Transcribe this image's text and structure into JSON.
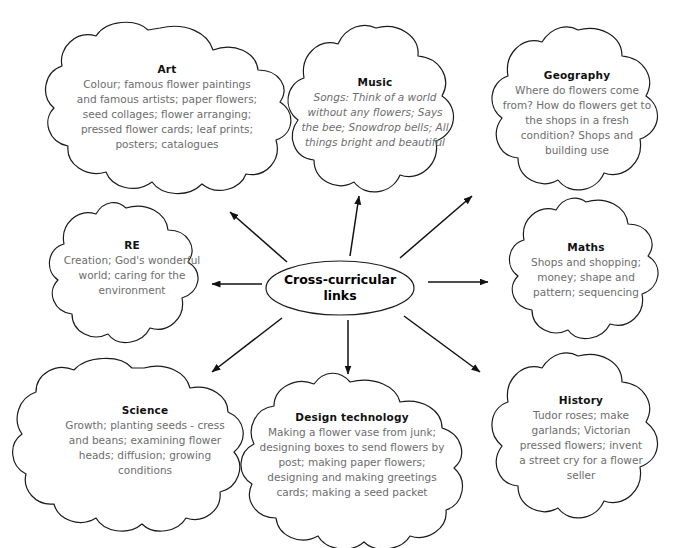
{
  "diagram": {
    "type": "mind-map",
    "title": "Cross-curricular links",
    "center": {
      "label": "Cross-curricular links",
      "shape": "ellipse"
    },
    "background_color": "#ffffff",
    "outline_color": "#1a1a1a",
    "body_text_color": "#6d6d6d",
    "arrow_count": 8,
    "nodes": [
      {
        "id": "art",
        "title": "Art",
        "body": "Colour; famous flower paintings and famous artists; paper flowers; seed collages; flower arranging; pressed flower cards; leaf prints; posters; catalogues",
        "position": "top-left",
        "shape": "cloud"
      },
      {
        "id": "music",
        "title": "Music",
        "body": "Songs: Think of a world without any flowers; Says the bee; Snowdrop bells; All things bright and beautiful",
        "position": "top-center",
        "shape": "flower",
        "italic": true
      },
      {
        "id": "geography",
        "title": "Geography",
        "body": "Where do flowers come from? How do flowers get to the shops in a fresh condition? Shops and building use",
        "position": "top-right",
        "shape": "flower"
      },
      {
        "id": "re",
        "title": "RE",
        "body": "Creation; God's wonderful world; caring for the environment",
        "position": "middle-left",
        "shape": "flower"
      },
      {
        "id": "maths",
        "title": "Maths",
        "body": "Shops and shopping; money; shape and pattern; sequencing",
        "position": "middle-right",
        "shape": "flower"
      },
      {
        "id": "science",
        "title": "Science",
        "body": "Growth; planting seeds - cress and beans; examining flower heads; diffusion; growing conditions",
        "position": "bottom-left",
        "shape": "cloud"
      },
      {
        "id": "design-technology",
        "title": "Design technology",
        "body": "Making a flower vase from junk; designing boxes to send flowers by post; making paper flowers; designing and making greetings cards; making a seed packet",
        "position": "bottom-center",
        "shape": "cloud"
      },
      {
        "id": "history",
        "title": "History",
        "body": "Tudor roses; make garlands; Victorian pressed flowers; invent a street cry for a flower seller",
        "position": "bottom-right",
        "shape": "flower"
      }
    ]
  }
}
